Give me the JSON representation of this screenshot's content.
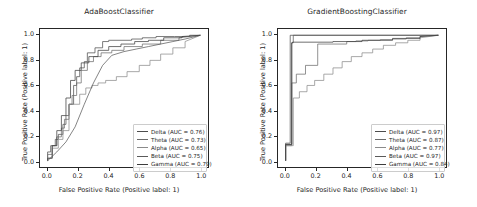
{
  "figure": {
    "background": "#ffffff",
    "width": 477,
    "height": 207
  },
  "chart_data": [
    {
      "type": "line",
      "title": "AdaBoostClassifier",
      "xlabel": "False Positive Rate (Positive label: 1)",
      "ylabel": "True Positive Rate (Positive label: 1)",
      "xlim": [
        -0.05,
        1.05
      ],
      "ylim": [
        -0.05,
        1.05
      ],
      "xticks": [
        "0.0",
        "0.2",
        "0.4",
        "0.6",
        "0.8",
        "1.0"
      ],
      "yticks": [
        "0.0",
        "0.2",
        "0.4",
        "0.6",
        "0.8",
        "1.0"
      ],
      "grid": false,
      "legend_position": "lower right",
      "series": [
        {
          "name": "Delta",
          "auc": 0.76,
          "legend_label": "Delta (AUC = 0.76)",
          "color": "#4d4d4d",
          "x": [
            0.0,
            0.0,
            0.02,
            0.02,
            0.05,
            0.05,
            0.07,
            0.07,
            0.1,
            0.1,
            0.12,
            0.12,
            0.14,
            0.14,
            0.17,
            0.17,
            0.19,
            0.19,
            0.21,
            0.21,
            0.24,
            0.24,
            0.26,
            0.26,
            0.31,
            0.31,
            0.36,
            0.36,
            0.4,
            0.4,
            0.55,
            0.55,
            0.62,
            0.62,
            0.71,
            0.71,
            0.83,
            0.83,
            0.93,
            0.93,
            1.0
          ],
          "y": [
            0.0,
            0.07,
            0.07,
            0.12,
            0.12,
            0.17,
            0.17,
            0.21,
            0.21,
            0.29,
            0.29,
            0.36,
            0.36,
            0.45,
            0.45,
            0.6,
            0.6,
            0.67,
            0.67,
            0.74,
            0.74,
            0.79,
            0.79,
            0.86,
            0.86,
            0.9,
            0.9,
            0.95,
            0.95,
            0.96,
            0.96,
            0.97,
            0.97,
            0.98,
            0.98,
            0.99,
            0.99,
            0.99,
            0.99,
            1.0,
            1.0
          ]
        },
        {
          "name": "Theta",
          "auc": 0.73,
          "legend_label": "Theta (AUC = 0.73)",
          "color": "#6b6b6b",
          "x": [
            0.0,
            0.0,
            0.03,
            0.03,
            0.06,
            0.06,
            0.09,
            0.09,
            0.11,
            0.11,
            0.14,
            0.14,
            0.16,
            0.16,
            0.19,
            0.19,
            0.22,
            0.22,
            0.26,
            0.26,
            0.3,
            0.3,
            0.35,
            0.35,
            0.42,
            0.42,
            0.5,
            0.5,
            0.62,
            0.62,
            0.74,
            0.74,
            0.86,
            0.86,
            1.0
          ],
          "y": [
            0.0,
            0.05,
            0.05,
            0.12,
            0.12,
            0.19,
            0.19,
            0.26,
            0.26,
            0.33,
            0.33,
            0.45,
            0.45,
            0.52,
            0.52,
            0.62,
            0.62,
            0.72,
            0.72,
            0.79,
            0.79,
            0.83,
            0.83,
            0.86,
            0.86,
            0.88,
            0.88,
            0.91,
            0.91,
            0.93,
            0.93,
            0.96,
            0.96,
            0.98,
            1.0
          ]
        },
        {
          "name": "Alpha",
          "auc": 0.65,
          "legend_label": "Alpha (AUC = 0.65)",
          "color": "#8a8a8a",
          "x": [
            0.0,
            0.0,
            0.03,
            0.03,
            0.07,
            0.07,
            0.1,
            0.1,
            0.14,
            0.14,
            0.17,
            0.17,
            0.21,
            0.21,
            0.25,
            0.25,
            0.29,
            0.29,
            0.33,
            0.33,
            0.38,
            0.38,
            0.45,
            0.45,
            0.52,
            0.52,
            0.6,
            0.6,
            0.67,
            0.67,
            0.74,
            0.74,
            0.82,
            0.82,
            0.9,
            0.9,
            1.0
          ],
          "y": [
            0.0,
            0.02,
            0.02,
            0.1,
            0.1,
            0.17,
            0.17,
            0.24,
            0.24,
            0.45,
            0.45,
            0.45,
            0.45,
            0.53,
            0.53,
            0.58,
            0.58,
            0.6,
            0.6,
            0.62,
            0.62,
            0.64,
            0.64,
            0.67,
            0.67,
            0.71,
            0.71,
            0.76,
            0.76,
            0.8,
            0.8,
            0.85,
            0.85,
            0.9,
            0.9,
            0.95,
            1.0
          ]
        },
        {
          "name": "Beta",
          "auc": 0.75,
          "legend_label": "Beta (AUC = 0.75)",
          "color": "#5a5a5a",
          "x": [
            0.0,
            0.06,
            0.12,
            0.18,
            0.24,
            0.3,
            0.36,
            0.42,
            0.5,
            0.58,
            0.66,
            0.74,
            0.82,
            0.9,
            1.0
          ],
          "y": [
            0.0,
            0.07,
            0.15,
            0.27,
            0.45,
            0.62,
            0.76,
            0.84,
            0.87,
            0.89,
            0.91,
            0.93,
            0.95,
            0.97,
            1.0
          ]
        },
        {
          "name": "Gamma",
          "auc": 0.79,
          "legend_label": "Gamma (AUC = 0.79)",
          "color": "#3d3d3d",
          "x": [
            0.0,
            0.0,
            0.03,
            0.03,
            0.06,
            0.06,
            0.09,
            0.09,
            0.12,
            0.12,
            0.15,
            0.15,
            0.18,
            0.18,
            0.22,
            0.22,
            0.27,
            0.27,
            0.33,
            0.33,
            0.4,
            0.4,
            0.48,
            0.48,
            0.57,
            0.57,
            0.66,
            0.66,
            0.76,
            0.76,
            0.88,
            0.88,
            1.0
          ],
          "y": [
            0.0,
            0.02,
            0.02,
            0.12,
            0.12,
            0.24,
            0.24,
            0.36,
            0.36,
            0.5,
            0.5,
            0.64,
            0.64,
            0.72,
            0.72,
            0.78,
            0.78,
            0.83,
            0.83,
            0.88,
            0.88,
            0.91,
            0.91,
            0.93,
            0.93,
            0.95,
            0.95,
            0.96,
            0.96,
            0.98,
            0.98,
            0.99,
            1.0
          ]
        }
      ]
    },
    {
      "type": "line",
      "title": "GradientBoostingClassifier",
      "xlabel": "False Positive Rate (Positive label: 1)",
      "ylabel": "True Positive Rate (Positive label: 1)",
      "xlim": [
        -0.05,
        1.05
      ],
      "ylim": [
        -0.05,
        1.05
      ],
      "xticks": [
        "0.0",
        "0.2",
        "0.4",
        "0.6",
        "0.8",
        "1.0"
      ],
      "yticks": [
        "0.0",
        "0.2",
        "0.4",
        "0.6",
        "0.8",
        "1.0"
      ],
      "grid": false,
      "legend_position": "lower right",
      "series": [
        {
          "name": "Delta",
          "auc": 0.97,
          "legend_label": "Delta (AUC = 0.97)",
          "color": "#4d4d4d",
          "x": [
            0.0,
            0.0,
            0.03,
            0.03,
            1.0
          ],
          "y": [
            0.0,
            0.14,
            0.14,
            1.0,
            1.0
          ]
        },
        {
          "name": "Theta",
          "auc": 0.87,
          "legend_label": "Theta (AUC = 0.87)",
          "color": "#6b6b6b",
          "x": [
            0.0,
            0.0,
            0.04,
            0.04,
            0.07,
            0.07,
            0.13,
            0.13,
            0.21,
            0.21,
            0.4,
            0.4,
            0.46,
            0.46,
            0.54,
            0.54,
            0.62,
            0.62,
            0.7,
            0.7,
            0.79,
            0.79,
            0.88,
            0.88,
            1.0
          ],
          "y": [
            0.0,
            0.12,
            0.12,
            0.62,
            0.62,
            0.69,
            0.69,
            0.76,
            0.76,
            0.93,
            0.93,
            0.95,
            0.95,
            0.955,
            0.955,
            0.96,
            0.96,
            0.965,
            0.965,
            0.97,
            0.97,
            0.98,
            0.98,
            0.99,
            1.0
          ]
        },
        {
          "name": "Alpha",
          "auc": 0.77,
          "legend_label": "Alpha (AUC = 0.77)",
          "color": "#8a8a8a",
          "x": [
            0.0,
            0.0,
            0.05,
            0.05,
            0.09,
            0.09,
            0.14,
            0.14,
            0.19,
            0.19,
            0.25,
            0.25,
            0.31,
            0.31,
            0.37,
            0.37,
            0.43,
            0.43,
            0.5,
            0.5,
            0.57,
            0.57,
            0.64,
            0.64,
            0.72,
            0.72,
            0.8,
            0.8,
            0.88,
            0.88,
            1.0
          ],
          "y": [
            0.0,
            0.12,
            0.12,
            0.5,
            0.5,
            0.55,
            0.55,
            0.6,
            0.6,
            0.64,
            0.64,
            0.69,
            0.69,
            0.74,
            0.74,
            0.79,
            0.79,
            0.83,
            0.83,
            0.86,
            0.86,
            0.89,
            0.89,
            0.92,
            0.92,
            0.94,
            0.94,
            0.96,
            0.96,
            0.98,
            1.0
          ]
        },
        {
          "name": "Beta",
          "auc": 0.97,
          "legend_label": "Beta (AUC = 0.97)",
          "color": "#5a5a5a",
          "x": [
            0.0,
            0.0,
            0.04,
            0.04,
            0.05,
            0.05,
            1.0
          ],
          "y": [
            0.0,
            0.13,
            0.13,
            0.94,
            0.94,
            1.0,
            1.0
          ]
        },
        {
          "name": "Gamma",
          "auc": 0.84,
          "legend_label": "Gamma (AUC = 0.84)",
          "color": "#3d3d3d",
          "x": [
            0.0,
            0.0,
            0.04,
            0.04,
            0.045,
            0.045,
            0.31,
            0.31,
            0.5,
            0.5,
            0.7,
            0.7,
            0.88,
            0.88,
            1.0
          ],
          "y": [
            0.0,
            0.13,
            0.13,
            0.94,
            0.94,
            0.945,
            0.945,
            0.95,
            0.95,
            0.96,
            0.96,
            0.975,
            0.975,
            0.99,
            1.0
          ]
        }
      ]
    }
  ]
}
